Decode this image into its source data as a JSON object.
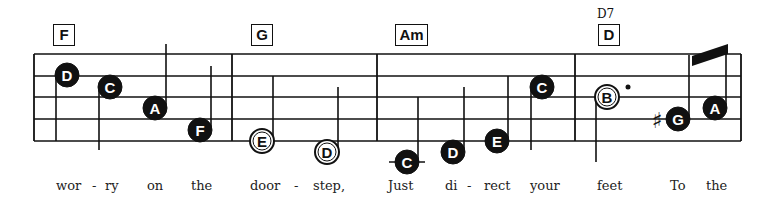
{
  "score": {
    "staff": {
      "left": 34,
      "right": 741,
      "lines_y": [
        54,
        76,
        97,
        119,
        141
      ],
      "line_color": "#111111"
    },
    "barlines_x": [
      34,
      232,
      377,
      575,
      741
    ],
    "chords": [
      {
        "label": "F",
        "x": 53,
        "width": 20
      },
      {
        "label": "G",
        "x": 251,
        "width": 20
      },
      {
        "label": "Am",
        "x": 395,
        "width": 31
      },
      {
        "label": "D",
        "x": 598,
        "width": 20,
        "alt": "D7"
      }
    ],
    "notes": [
      {
        "name": "D",
        "x": 67,
        "y": 75,
        "filled": true,
        "stem": "down",
        "stem_end": 141
      },
      {
        "name": "C",
        "x": 110,
        "y": 87,
        "filled": true,
        "stem": "down",
        "stem_end": 150
      },
      {
        "name": "A",
        "x": 155,
        "y": 108,
        "filled": true,
        "stem": "up",
        "stem_end": 44
      },
      {
        "name": "F",
        "x": 200,
        "y": 130,
        "filled": true,
        "stem": "up",
        "stem_end": 66
      },
      {
        "name": "E",
        "x": 262,
        "y": 141,
        "filled": false,
        "stem": "up",
        "stem_end": 76
      },
      {
        "name": "D",
        "x": 327,
        "y": 152,
        "filled": false,
        "stem": "up",
        "stem_end": 87
      },
      {
        "name": "C",
        "x": 407,
        "y": 162,
        "filled": true,
        "stem": "up",
        "stem_end": 97,
        "ledger": true
      },
      {
        "name": "D",
        "x": 453,
        "y": 152,
        "filled": true,
        "stem": "up",
        "stem_end": 87
      },
      {
        "name": "E",
        "x": 497,
        "y": 141,
        "filled": true,
        "stem": "up",
        "stem_end": 76
      },
      {
        "name": "C",
        "x": 542,
        "y": 87,
        "filled": true,
        "stem": "down",
        "stem_end": 150
      },
      {
        "name": "B",
        "x": 607,
        "y": 97,
        "filled": false,
        "stem": "down",
        "stem_end": 162,
        "dotted": true
      },
      {
        "name": "G",
        "x": 678,
        "y": 119,
        "filled": true,
        "stem": "up",
        "stem_end": 55,
        "sharp": true
      },
      {
        "name": "A",
        "x": 715,
        "y": 108,
        "filled": true,
        "stem": "up",
        "stem_end": 45
      }
    ],
    "beam": {
      "x1": 692,
      "y1": 56,
      "x2": 728,
      "y2": 44,
      "thickness": 10
    },
    "lyrics": [
      {
        "text": "wor",
        "x": 56
      },
      {
        "text": "-",
        "x": 92
      },
      {
        "text": "ry",
        "x": 105
      },
      {
        "text": "on",
        "x": 147
      },
      {
        "text": "the",
        "x": 191
      },
      {
        "text": "door",
        "x": 250
      },
      {
        "text": "-",
        "x": 294
      },
      {
        "text": "step,",
        "x": 313
      },
      {
        "text": "Just",
        "x": 388
      },
      {
        "text": "di",
        "x": 445
      },
      {
        "text": "-",
        "x": 467
      },
      {
        "text": "rect",
        "x": 484
      },
      {
        "text": "your",
        "x": 530
      },
      {
        "text": "feet",
        "x": 597
      },
      {
        "text": "To",
        "x": 670
      },
      {
        "text": "the",
        "x": 706
      }
    ]
  }
}
